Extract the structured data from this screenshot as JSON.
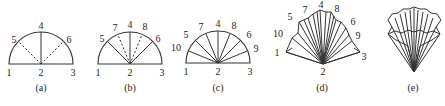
{
  "panels": [
    {
      "id": "a",
      "caption": "(a)",
      "labels": {
        "p1": "1",
        "p2": "2",
        "p3": "3",
        "p4": "4",
        "p5": "5",
        "p6": "6"
      }
    },
    {
      "id": "b",
      "caption": "(b)",
      "labels": {
        "p1": "1",
        "p2": "2",
        "p3": "3",
        "p4": "4",
        "p5": "5",
        "p6": "6",
        "p7": "7",
        "p8": "8"
      }
    },
    {
      "id": "c",
      "caption": "(c)",
      "labels": {
        "p1": "1",
        "p2": "2",
        "p3": "3",
        "p4": "4",
        "p5": "5",
        "p6": "6",
        "p7": "7",
        "p8": "8",
        "p9": "9",
        "p10": "10"
      }
    },
    {
      "id": "d",
      "caption": "(d)",
      "labels": {
        "p1": "1",
        "p2": "2",
        "p3": "3",
        "p4": "4",
        "p5": "5",
        "p6": "6",
        "p7": "7",
        "p8": "8",
        "p9": "9",
        "p10": "10"
      }
    },
    {
      "id": "e",
      "caption": "(e)"
    }
  ],
  "colors": {
    "line": "#333333"
  }
}
